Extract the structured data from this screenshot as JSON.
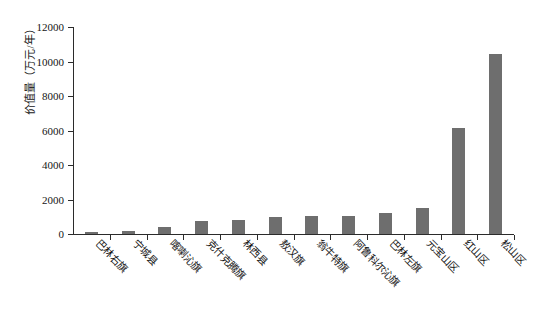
{
  "chart_data": {
    "type": "bar",
    "title": "",
    "xlabel": "",
    "ylabel": "价值量（万元/年）",
    "ylim": [
      0,
      12000
    ],
    "ytick_labels": [
      "12000",
      "10000",
      "8000",
      "6000",
      "4000",
      "2000",
      "0"
    ],
    "yticks": [
      12000,
      10000,
      8000,
      6000,
      4000,
      2000,
      0
    ],
    "grid": false,
    "legend": "none",
    "bar_color": "#6e6e6e",
    "axis_color": "#2b2b2b",
    "categories": [
      "巴林右旗",
      "宁城县",
      "喀喇沁旗",
      "克什克腾旗",
      "林西县",
      "敖汉旗",
      "翁牛特旗",
      "阿鲁科尔沁旗",
      "巴林左旗",
      "元宝山区",
      "红山区",
      "松山区"
    ],
    "values": [
      100,
      200,
      400,
      750,
      800,
      1000,
      1030,
      1070,
      1200,
      1500,
      6150,
      10450
    ]
  }
}
